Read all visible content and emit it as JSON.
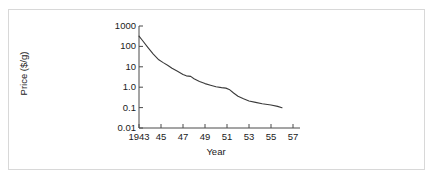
{
  "chart_data": {
    "type": "line",
    "title": "",
    "xlabel": "Year",
    "ylabel": "Price ($/g)",
    "yscale": "log",
    "xlim": [
      1943,
      1957
    ],
    "ylim": [
      0.01,
      1000
    ],
    "grid": false,
    "legend": null,
    "xticks": [
      {
        "value": 1943,
        "label": "1943"
      },
      {
        "value": 1945,
        "label": "45"
      },
      {
        "value": 1947,
        "label": "47"
      },
      {
        "value": 1949,
        "label": "49"
      },
      {
        "value": 1951,
        "label": "51"
      },
      {
        "value": 1953,
        "label": "53"
      },
      {
        "value": 1955,
        "label": "55"
      },
      {
        "value": 1957,
        "label": "57"
      }
    ],
    "yticks": [
      {
        "value": 1000,
        "label": "1000"
      },
      {
        "value": 100,
        "label": "100"
      },
      {
        "value": 10,
        "label": "10"
      },
      {
        "value": 1.0,
        "label": "1.0"
      },
      {
        "value": 0.1,
        "label": "0.1"
      },
      {
        "value": 0.01,
        "label": "0.01"
      }
    ],
    "series": [
      {
        "name": "Price",
        "color": "#3a3a3a",
        "x": [
          1943.0,
          1943.3,
          1943.8,
          1944.3,
          1944.8,
          1945.2,
          1945.6,
          1946.0,
          1946.5,
          1947.0,
          1947.3,
          1947.7,
          1948.0,
          1948.5,
          1949.0,
          1949.5,
          1950.0,
          1950.5,
          1950.9,
          1951.2,
          1951.6,
          1952.0,
          1952.5,
          1953.0,
          1953.6,
          1954.2,
          1955.0,
          1955.6,
          1956.0
        ],
        "y": [
          320.0,
          200.0,
          90.0,
          42.0,
          22.0,
          16.0,
          12.0,
          8.5,
          6.0,
          4.2,
          3.6,
          3.4,
          2.6,
          1.9,
          1.5,
          1.25,
          1.05,
          0.95,
          0.9,
          0.78,
          0.52,
          0.36,
          0.27,
          0.21,
          0.18,
          0.155,
          0.135,
          0.115,
          0.098
        ]
      }
    ]
  },
  "axes": {
    "ylabel": "Price ($/g)",
    "xlabel": "Year"
  }
}
